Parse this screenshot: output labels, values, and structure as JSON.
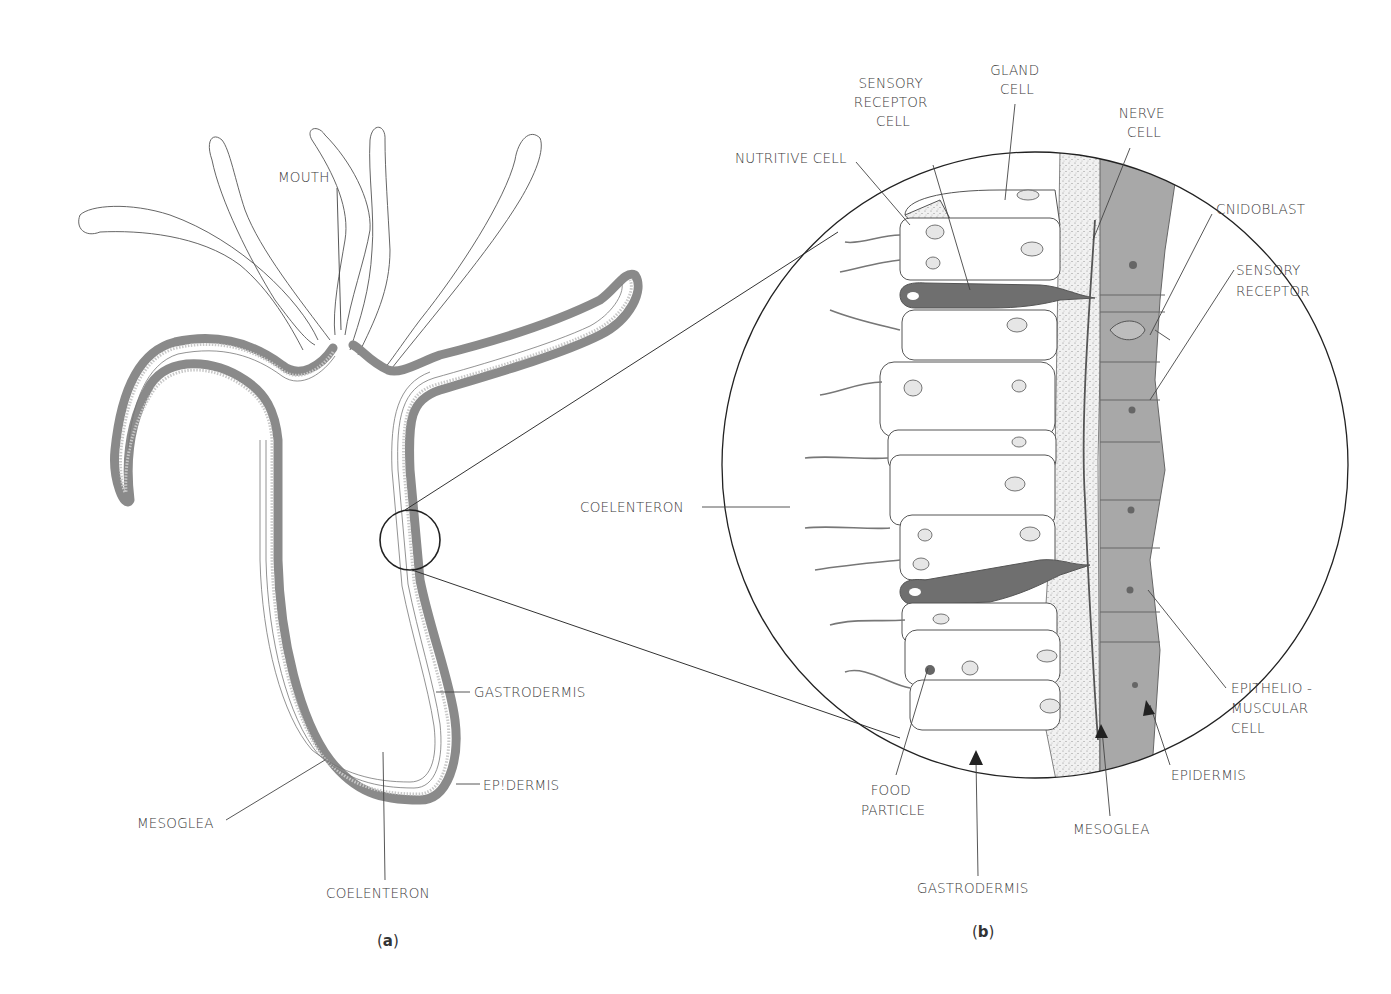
{
  "figure": {
    "panels": [
      {
        "id": "a",
        "caption": "a"
      },
      {
        "id": "b",
        "caption": "b"
      }
    ]
  },
  "panel_a": {
    "labels": {
      "mouth": "MOUTH",
      "gastrodermis": "GASTRODERMIS",
      "epidermis": "EP!DERMIS",
      "mesoglea": "MESOGLEA",
      "coelenteron": "COELENTERON"
    }
  },
  "panel_b": {
    "labels": {
      "sensory_receptor_cell": [
        "SENSORY",
        "RECEPTOR",
        "CELL"
      ],
      "gland_cell": [
        "GLAND",
        "CELL"
      ],
      "nerve_cell": [
        "NERVE",
        "CELL"
      ],
      "nutritive_cell": "NUTRITIVE CELL",
      "cnidoblast": "CNIDOBLAST",
      "sensory_receptor": [
        "SENSORY",
        "RECEPTOR"
      ],
      "coelenteron": "COELENTERON",
      "epitheliomuscular_cell": [
        "EPITHELIO -",
        "MUSCULAR",
        "CELL"
      ],
      "epidermis": "EPIDERMIS",
      "mesoglea": "MESOGLEA",
      "food_particle": [
        "FOOD",
        "PARTICLE"
      ],
      "gastrodermis": "GASTRODERMIS"
    }
  },
  "colors": {
    "epidermis_fill": "#a8a8a8",
    "sensory_cell_fill": "#6f6f6f",
    "line": "#444444",
    "text": "#3a3a3a"
  }
}
